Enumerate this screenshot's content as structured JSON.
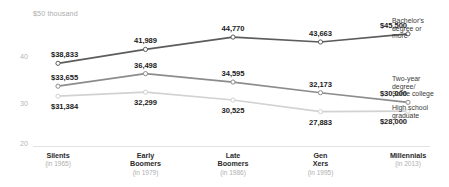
{
  "chart_data": {
    "type": "line",
    "title": "",
    "subtitle": "",
    "xlabel": "",
    "ylabel": "$50 thousand",
    "ylim": [
      20000,
      50000
    ],
    "ytick_labels": [
      "$50 thousand",
      "40",
      "30",
      "20"
    ],
    "ytick_values": [
      50000,
      40000,
      30000,
      20000
    ],
    "grid": false,
    "legend_position": "right",
    "categories": [
      "Silents",
      "Early Boomers",
      "Late Boomers",
      "Gen Xers",
      "Millennials"
    ],
    "category_years": [
      "(in 1965)",
      "(in 1979)",
      "(in 1986)",
      "(in 1995)",
      "(in 2013)"
    ],
    "series": [
      {
        "name": "Bachelor's degree or more",
        "color": "#5c5c5c",
        "values": [
          38833,
          41989,
          44770,
          43663,
          45500
        ],
        "labels": [
          "$38,833",
          "41,989",
          "44,770",
          "43,663",
          "$45,500"
        ]
      },
      {
        "name": "Two-year degree/ Some college",
        "color": "#8c8c8c",
        "values": [
          33655,
          36498,
          34595,
          32173,
          30000
        ],
        "labels": [
          "$33,655",
          "36,498",
          "34,595",
          "32,173",
          "$30,000"
        ]
      },
      {
        "name": "High school graduate",
        "color": "#d2d2d2",
        "values": [
          31384,
          32299,
          30525,
          27883,
          28000
        ],
        "labels": [
          "$31,384",
          "32,299",
          "30,525",
          "27,883",
          "$28,000"
        ]
      }
    ]
  },
  "legend": [
    {
      "line1": "Bachelor's",
      "line2": "degree or",
      "line3": "more"
    },
    {
      "line1": "Two-year",
      "line2": "degree/",
      "line3": "Some college"
    },
    {
      "line1": "High school",
      "line2": "graduate",
      "line3": ""
    }
  ],
  "colors": {
    "series_bachelors": "#5c5c5c",
    "series_twoyear": "#8c8c8c",
    "series_highschool": "#d2d2d2",
    "axis": "#d8d8d8",
    "label_text": "#1c1c1c",
    "muted_text": "#b0b0b0"
  }
}
